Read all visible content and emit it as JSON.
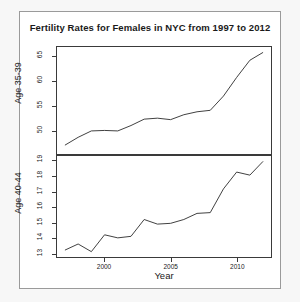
{
  "chart_data": {
    "type": "line",
    "title": "Fertility Rates for Females in NYC from 1997 to 2012",
    "xlabel": "Year",
    "ylabel": "",
    "grid": false,
    "legend": "none",
    "x": [
      1997,
      1998,
      1999,
      2000,
      2001,
      2002,
      2003,
      2004,
      2005,
      2006,
      2007,
      2008,
      2009,
      2010,
      2011,
      2012
    ],
    "xlim": [
      1996.4,
      2012.6
    ],
    "xticks": [
      2000,
      2005,
      2010
    ],
    "xticklabels": [
      "2000",
      "2005",
      "2010"
    ],
    "panels": [
      {
        "name": "Age 35-39",
        "ylabel": "Age 35-39",
        "ylim": [
          45.2,
          67.0
        ],
        "yticks": [
          50,
          55,
          60,
          65
        ],
        "yticklabels": [
          "50",
          "55",
          "60",
          "65"
        ],
        "values": [
          47.0,
          48.6,
          49.9,
          50.0,
          49.9,
          51.0,
          52.3,
          52.5,
          52.2,
          53.2,
          53.8,
          54.1,
          57.0,
          60.8,
          64.3,
          65.9
        ]
      },
      {
        "name": "Age 40-44",
        "ylabel": "Age 40-44",
        "ylim": [
          12.75,
          19.35
        ],
        "yticks": [
          13,
          14,
          15,
          16,
          17,
          18,
          19
        ],
        "yticklabels": [
          "13",
          "14",
          "15",
          "16",
          "17",
          "18",
          "19"
        ],
        "values": [
          13.2,
          13.6,
          13.1,
          14.2,
          14.0,
          14.1,
          15.2,
          14.9,
          14.95,
          15.2,
          15.6,
          15.65,
          17.2,
          18.3,
          18.1,
          19.0
        ]
      }
    ]
  }
}
